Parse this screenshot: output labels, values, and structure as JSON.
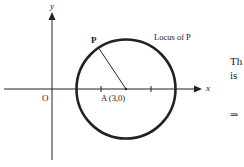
{
  "diagram": {
    "axes": {
      "x_label": "x",
      "y_label": "y",
      "origin_label": "O"
    },
    "point_P": "P",
    "center_label": "A (3,0)",
    "circle_label": "Locus of P",
    "side_text": {
      "line1": "Th",
      "line2": "is",
      "arrow": "⇒"
    }
  }
}
